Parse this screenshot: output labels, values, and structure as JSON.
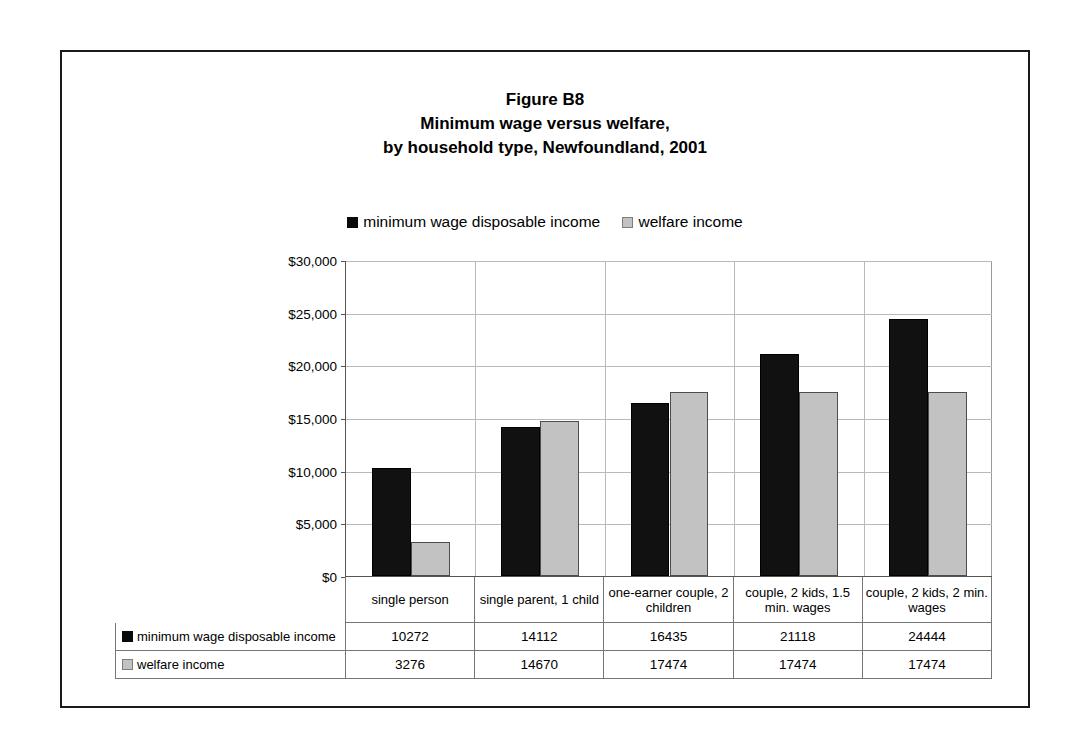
{
  "figure": {
    "title_lines": [
      "Figure B8",
      "Minimum wage versus welfare,",
      "by household type, Newfoundland, 2001"
    ]
  },
  "colors": {
    "series_minimum_wage": "#111111",
    "series_welfare": "#c2c2c2",
    "gridline": "#b9b9b9",
    "axis": "#555555",
    "frame": "#1a1a1a"
  },
  "legend": {
    "position": "top",
    "entries": [
      {
        "label": "minimum wage disposable income",
        "swatch": "black-square-icon"
      },
      {
        "label": "welfare income",
        "swatch": "gray-square-icon"
      }
    ]
  },
  "chart_data": {
    "type": "bar",
    "xlabel": "",
    "ylabel": "",
    "ylim": [
      0,
      30000
    ],
    "ytick_labels": [
      "$30,000",
      "$25,000",
      "$20,000",
      "$15,000",
      "$10,000",
      "$5,000",
      "$0"
    ],
    "ytick_values": [
      30000,
      25000,
      20000,
      15000,
      10000,
      5000,
      0
    ],
    "grid": true,
    "categories": [
      "single person",
      "single parent, 1 child",
      "one-earner couple, 2 children",
      "couple, 2 kids, 1.5 min. wages",
      "couple, 2 kids, 2 min. wages"
    ],
    "series": [
      {
        "name": "minimum wage disposable income",
        "values": [
          10272,
          14112,
          16435,
          21118,
          24444
        ]
      },
      {
        "name": "welfare income",
        "values": [
          3276,
          14670,
          17474,
          17474,
          17474
        ]
      }
    ]
  },
  "data_table": {
    "row_labels": [
      "minimum wage disposable income",
      "welfare income"
    ],
    "rows": [
      [
        "10272",
        "14112",
        "16435",
        "21118",
        "24444"
      ],
      [
        "3276",
        "14670",
        "17474",
        "17474",
        "17474"
      ]
    ]
  }
}
